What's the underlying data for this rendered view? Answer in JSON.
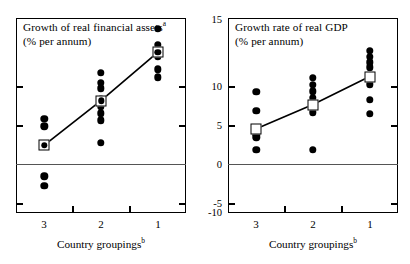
{
  "figure": {
    "width": 410,
    "height": 264,
    "background": "#ffffff",
    "ink_color": "#000000"
  },
  "chart_data": [
    {
      "id": "left",
      "type": "scatter",
      "title": "Growth of real financial assets",
      "title_superscript": "a",
      "title_line2": "(% per annum)",
      "xlabel": "Country groupings",
      "xlabel_superscript": "b",
      "ylabel": "",
      "categories": [
        "3",
        "2",
        "1"
      ],
      "xlim": [
        0,
        3
      ],
      "ylim": [
        -10,
        15
      ],
      "yticks": [
        15,
        10,
        5,
        0,
        -5,
        -10
      ],
      "ytick_labels": [
        "15",
        "10",
        "5",
        "0",
        "-5",
        "-10"
      ],
      "yaxis_side": "right",
      "grid": false,
      "zero_line": true,
      "legend": "none",
      "series": [
        {
          "name": "Country observations",
          "marker": "filled-circle",
          "points": [
            {
              "group": "3",
              "value": 2.1
            },
            {
              "group": "3",
              "value": 1.1
            },
            {
              "group": "3",
              "value": -1.3
            },
            {
              "group": "3",
              "value": -5.3
            },
            {
              "group": "3",
              "value": -6.5
            },
            {
              "group": "2",
              "value": 8.0
            },
            {
              "group": "2",
              "value": 6.7
            },
            {
              "group": "2",
              "value": 6.0
            },
            {
              "group": "2",
              "value": 4.6
            },
            {
              "group": "2",
              "value": 3.6
            },
            {
              "group": "2",
              "value": 2.8
            },
            {
              "group": "2",
              "value": 1.9
            },
            {
              "group": "2",
              "value": -1.0
            },
            {
              "group": "1",
              "value": 13.6
            },
            {
              "group": "1",
              "value": 11.6
            },
            {
              "group": "1",
              "value": 10.8
            },
            {
              "group": "1",
              "value": 10.1
            },
            {
              "group": "1",
              "value": 8.4
            },
            {
              "group": "1",
              "value": 7.4
            }
          ]
        },
        {
          "name": "Group mean",
          "marker": "open-square",
          "connected": true,
          "points": [
            {
              "group": "3",
              "value": -1.3
            },
            {
              "group": "2",
              "value": 4.4
            },
            {
              "group": "1",
              "value": 10.6
            }
          ]
        }
      ]
    },
    {
      "id": "right",
      "type": "scatter",
      "title": "Growth rate of real GDP",
      "title_superscript": "",
      "title_line2": "(% per annum)",
      "xlabel": "Country groupings",
      "xlabel_superscript": "b",
      "ylabel": "",
      "categories": [
        "3",
        "2",
        "1"
      ],
      "xlim": [
        0,
        3
      ],
      "ylim": [
        -10,
        15
      ],
      "yticks": [
        15,
        10,
        5,
        0,
        -5,
        -10
      ],
      "ytick_labels": [
        "15",
        "10",
        "5",
        "0",
        "-5",
        "-10"
      ],
      "yaxis_side": "left",
      "grid": false,
      "zero_line": true,
      "legend": "none",
      "series": [
        {
          "name": "Country observations",
          "marker": "filled-circle",
          "points": [
            {
              "group": "3",
              "value": 5.5
            },
            {
              "group": "3",
              "value": 3.1
            },
            {
              "group": "3",
              "value": 0.6
            },
            {
              "group": "3",
              "value": 0.1
            },
            {
              "group": "3",
              "value": -0.3
            },
            {
              "group": "3",
              "value": -1.9
            },
            {
              "group": "2",
              "value": 7.3
            },
            {
              "group": "2",
              "value": 6.4
            },
            {
              "group": "2",
              "value": 5.6
            },
            {
              "group": "2",
              "value": 4.8
            },
            {
              "group": "2",
              "value": 3.9
            },
            {
              "group": "2",
              "value": 2.9
            },
            {
              "group": "2",
              "value": -1.9
            },
            {
              "group": "1",
              "value": 10.8
            },
            {
              "group": "1",
              "value": 10.0
            },
            {
              "group": "1",
              "value": 9.3
            },
            {
              "group": "1",
              "value": 8.7
            },
            {
              "group": "1",
              "value": 6.5
            },
            {
              "group": "1",
              "value": 4.5
            },
            {
              "group": "1",
              "value": 2.7
            }
          ]
        },
        {
          "name": "Group mean",
          "marker": "open-square",
          "connected": true,
          "points": [
            {
              "group": "3",
              "value": 0.8
            },
            {
              "group": "2",
              "value": 3.9
            },
            {
              "group": "1",
              "value": 7.5
            }
          ]
        }
      ]
    }
  ]
}
